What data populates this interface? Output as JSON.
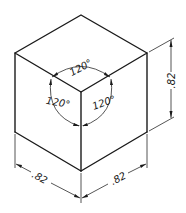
{
  "figure": {
    "axes_angles": [
      {
        "id": "top",
        "label": "120°"
      },
      {
        "id": "left",
        "label": "120°"
      },
      {
        "id": "right",
        "label": "120°"
      }
    ],
    "dimensions": [
      {
        "id": "height",
        "label": ".82"
      },
      {
        "id": "width-left",
        "label": ".82"
      },
      {
        "id": "width-right",
        "label": ".82"
      }
    ],
    "colors": {
      "line": "#1a1a1a",
      "background": "#ffffff"
    }
  }
}
